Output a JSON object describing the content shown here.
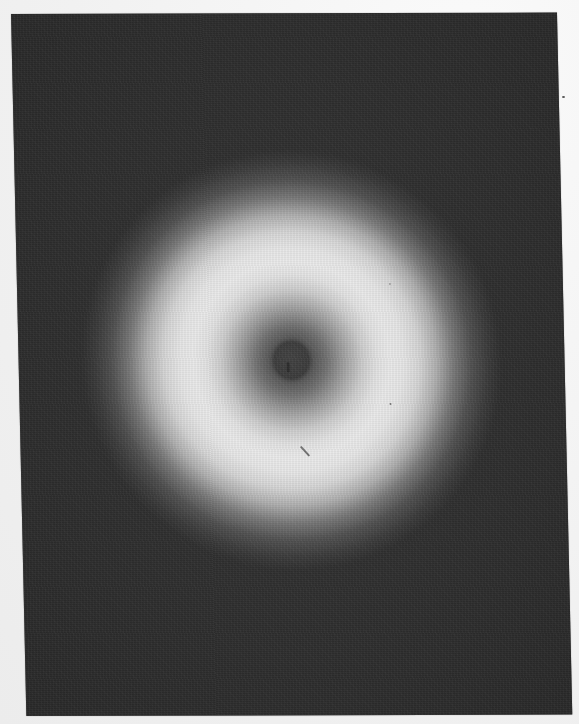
{
  "image": {
    "description": "Grayscale photograph of a diffraction/halo pattern: bright diffuse annular ring on dark background with a small dark circular spot at center",
    "background_color": "#2d2d2d",
    "page_margin_color": "#f4f4f4",
    "ring_peak_color": "#eeeeee",
    "center_spot_color": "#3a3a3a",
    "panel": {
      "left": 11,
      "top": 14,
      "right": 557,
      "bottom": 716
    },
    "ring": {
      "center_x": 284,
      "center_y": 361,
      "inner_dark_radius": 18,
      "peak_radius": 100,
      "outer_fade_radius": 170
    },
    "artifacts": [
      {
        "type": "scratch",
        "x": 290,
        "y": 455
      },
      {
        "type": "speck",
        "x": 563,
        "y": 97
      }
    ]
  }
}
